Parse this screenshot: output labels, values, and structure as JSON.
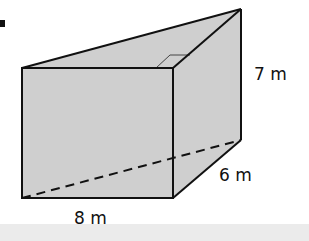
{
  "figure": {
    "bullet": "■",
    "labels": {
      "height": "7 m",
      "depth": "6 m",
      "width": "8 m"
    },
    "colors": {
      "fill": "#cfcfcf",
      "edge": "#111111",
      "background": "#ffffff",
      "strip": "#ebebeb"
    }
  }
}
